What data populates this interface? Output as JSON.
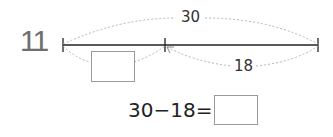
{
  "problem": {
    "number": "11",
    "total_label": "30",
    "part_label": "18",
    "equation": {
      "left": "30",
      "operator": "−",
      "right": "18",
      "equals": "=",
      "answer": ""
    },
    "unknown_part": ""
  },
  "colors": {
    "line": "#222222",
    "dotted_arc": "#b0b0b0",
    "box_border": "#9a9a9a",
    "number": "#6e6e6e"
  }
}
